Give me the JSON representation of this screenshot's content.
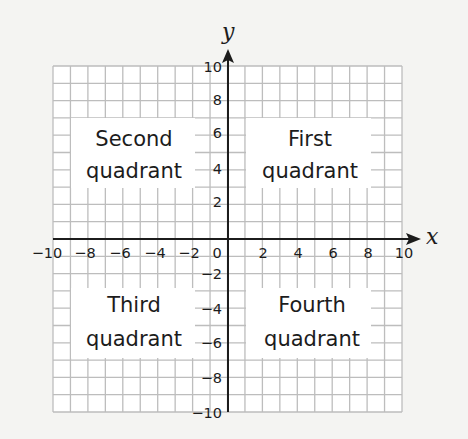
{
  "diagram": {
    "x_axis": {
      "label": "x",
      "min": -10,
      "max": 10,
      "tick_step": 2,
      "tick_labels": [
        "−10",
        "−8",
        "−6",
        "−4",
        "−2",
        "0",
        "2",
        "4",
        "6",
        "8",
        "10"
      ]
    },
    "y_axis": {
      "label": "y",
      "min": -10,
      "max": 10,
      "tick_step": 2,
      "tick_labels": [
        "10",
        "8",
        "6",
        "4",
        "2",
        "−2",
        "−4",
        "−6",
        "−8",
        "−10"
      ]
    },
    "grid": {
      "cells_per_side": 20,
      "unit": 1
    },
    "quadrants": [
      {
        "id": "second",
        "line1": "Second",
        "line2": "quadrant"
      },
      {
        "id": "first",
        "line1": "First",
        "line2": "quadrant"
      },
      {
        "id": "third",
        "line1": "Third",
        "line2": "quadrant"
      },
      {
        "id": "fourth",
        "line1": "Fourth",
        "line2": "quadrant"
      }
    ],
    "colors": {
      "background": "#f4f4f2",
      "grid_fill": "#ffffff",
      "grid_line": "#bdbdbd",
      "axis": "#1c1c1c",
      "text": "#1c1c1c"
    }
  }
}
